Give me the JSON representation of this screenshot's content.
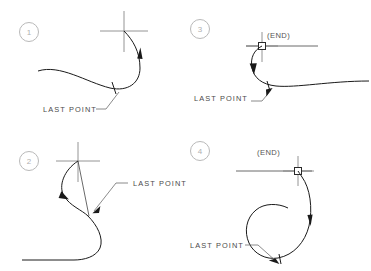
{
  "figure": {
    "background": "#ffffff",
    "stroke_color": "#1a1a1a",
    "marker_color": "#7a7a7a",
    "label_color": "#4a4a4a",
    "circle_number_color": "#b9b9b9",
    "width": 371,
    "height": 271
  },
  "panels": [
    {
      "id": "panel-1",
      "number": "1",
      "last_point_label": "LAST POINT",
      "end_label": null,
      "marker": "crosshair"
    },
    {
      "id": "panel-2",
      "number": "2",
      "last_point_label": "LAST POINT",
      "end_label": null,
      "marker": "crosshair"
    },
    {
      "id": "panel-3",
      "number": "3",
      "last_point_label": "LAST POINT",
      "end_label": "(END)",
      "marker": "crosshair-with-square-snap"
    },
    {
      "id": "panel-4",
      "number": "4",
      "last_point_label": "LAST POINT",
      "end_label": "(END)",
      "marker": "crosshair-with-square-snap"
    }
  ]
}
